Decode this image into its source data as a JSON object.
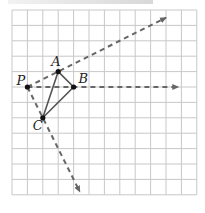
{
  "diagram": {
    "grid": {
      "cols": 12,
      "rows": 12,
      "origin_px": [
        12,
        10
      ],
      "cell_px": 15.4,
      "line_color": "#c8c8c8"
    },
    "points": [
      {
        "name": "P",
        "grid": [
          1,
          5
        ],
        "label_offset": [
          -11,
          -2
        ]
      },
      {
        "name": "A",
        "grid": [
          3,
          4
        ],
        "label_offset": [
          -7,
          -6
        ]
      },
      {
        "name": "B",
        "grid": [
          4,
          5
        ],
        "label_offset": [
          5,
          -4
        ]
      },
      {
        "name": "C",
        "grid": [
          2,
          7
        ],
        "label_offset": [
          -10,
          12
        ]
      }
    ],
    "triangle": {
      "vertices": [
        "A",
        "B",
        "C"
      ],
      "stroke": "#555555"
    },
    "rays": [
      {
        "from": "P",
        "through": "A",
        "to_grid": [
          10,
          0.5
        ]
      },
      {
        "from": "P",
        "through": "B",
        "to_grid": [
          10.8,
          5
        ]
      },
      {
        "from": "P",
        "through": "C",
        "to_grid": [
          4.4,
          11.8
        ]
      }
    ],
    "ray_color": "#666666"
  }
}
